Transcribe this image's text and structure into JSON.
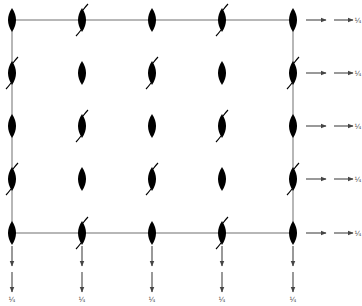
{
  "diagram": {
    "colors": {
      "symbol": "#000000",
      "frame": "#888888",
      "arrow": "#555555",
      "background": "#ffffff"
    },
    "frame": {
      "x0": 12,
      "y0": 20,
      "x1": 293,
      "y1": 233
    },
    "columns_x": [
      12,
      82,
      152,
      222,
      293
    ],
    "rows_y": [
      20,
      73,
      126,
      179,
      233
    ],
    "symbol_type": "twofold-axis-lens",
    "grid_pattern": [
      [
        "plain",
        "tail",
        "plain",
        "tail",
        "plain"
      ],
      [
        "tail",
        "plain",
        "tail",
        "plain",
        "tail"
      ],
      [
        "plain",
        "tail",
        "plain",
        "tail",
        "plain"
      ],
      [
        "tail",
        "plain",
        "tail",
        "plain",
        "tail"
      ],
      [
        "plain",
        "tail",
        "plain",
        "tail",
        "plain"
      ]
    ],
    "right_arrows": {
      "label": "¼",
      "count": 5
    },
    "down_arrows": {
      "label": "¼",
      "count": 5
    }
  }
}
